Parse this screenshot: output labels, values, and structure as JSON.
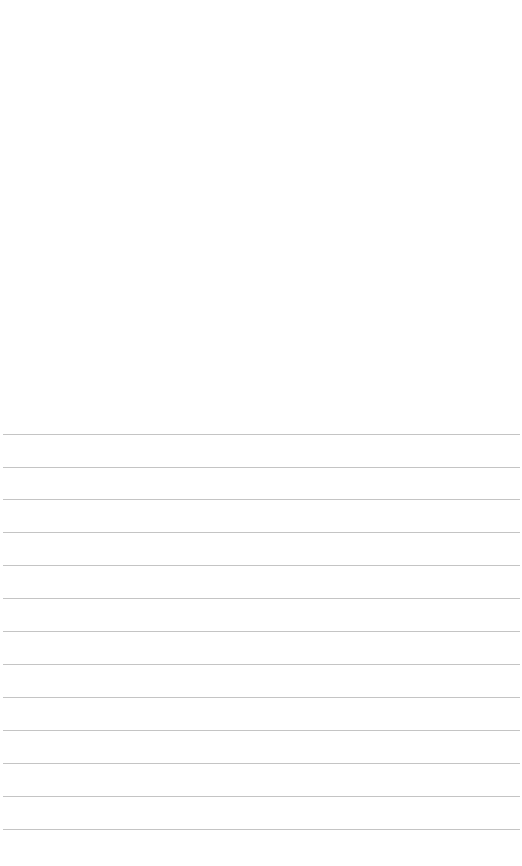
{
  "page": {
    "background": "#ffffff",
    "line_color": "#c4c4c4",
    "line_count": 13,
    "line_start_x": 3,
    "line_end_x": 520,
    "line_positions_y": [
      434,
      467,
      499,
      532,
      565,
      598,
      631,
      664,
      697,
      730,
      763,
      796,
      829
    ],
    "line_spacing": 33
  }
}
